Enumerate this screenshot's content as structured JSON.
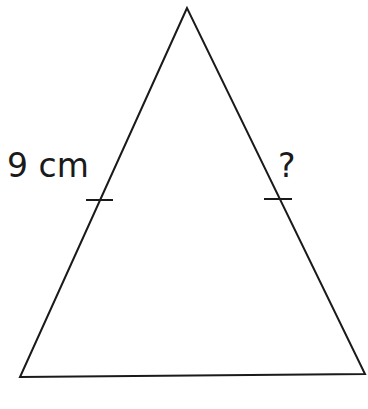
{
  "diagram": {
    "shape": "isosceles-triangle",
    "stroke_color": "#1a1a1a",
    "background": "#ffffff",
    "vertices": {
      "apex": [
        187,
        8
      ],
      "bottom_left": [
        20,
        377
      ],
      "bottom_right": [
        365,
        374
      ]
    },
    "tick_marks": {
      "left": [
        [
          86,
          200
        ],
        [
          113,
          200
        ]
      ],
      "right": [
        [
          264,
          199
        ],
        [
          292,
          199
        ]
      ]
    },
    "labels": {
      "left_side": "9 cm",
      "right_side": "?"
    }
  }
}
